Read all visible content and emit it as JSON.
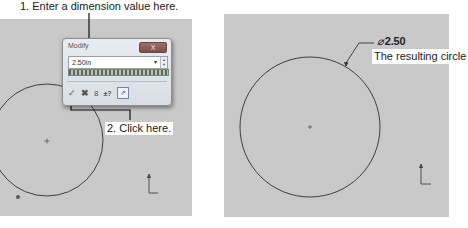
{
  "callouts": {
    "step1": "1. Enter a dimension value here.",
    "step2": "2. Click here.",
    "result": "The resulting circle"
  },
  "modify_dialog": {
    "title": "Modify",
    "close_label": "X",
    "value": "2.50in",
    "dropdown_glyph": "▾",
    "spin_up": "▲",
    "spin_down": "▼",
    "toolbar": {
      "ok_glyph": "✓",
      "cancel_glyph": "✖",
      "rebuild_glyph": "8",
      "reverse_glyph": "±?",
      "mark_glyph": "⇗"
    }
  },
  "result_panel": {
    "dimension_symbol": "⌀",
    "dimension_value": "2.50"
  },
  "colors": {
    "canvas": "#c9c9c9",
    "sketch_line": "#3a3a3a",
    "background": "#ffffff"
  }
}
